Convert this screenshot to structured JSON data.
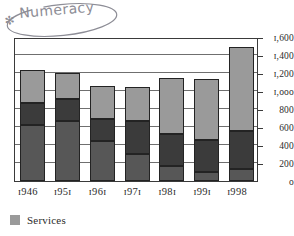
{
  "annotation": {
    "text": "Numeracy",
    "star_glyph": "✻",
    "color": "#8d8d96"
  },
  "legend": {
    "position": "below-chart",
    "entries": [
      {
        "label": "Services",
        "color": "#9a9a9a"
      }
    ]
  },
  "colors": {
    "services": "#9a9a9a",
    "middle_segment": "#3b3b3b",
    "base_segment": "#575757",
    "axis": "#3a3a3a",
    "gridline": "#6f6f6f",
    "text": "#2b2b2b"
  },
  "chart_data": {
    "type": "bar",
    "title": "",
    "subtitle": "",
    "xlabel": "",
    "ylabel": "",
    "stacked": true,
    "grid": true,
    "legend_position": "bottom-left",
    "ylim": [
      0,
      1600
    ],
    "ytick_values": [
      0,
      200,
      400,
      600,
      800,
      1000,
      1200,
      1400,
      1600
    ],
    "ytick_labels": [
      "o",
      "200",
      "400",
      "600",
      "800",
      "ɪ,ooo",
      "ɪ,200",
      "ɪ,400",
      "ɪ,600"
    ],
    "categories": [
      "1946",
      "1951",
      "1961",
      "1971",
      "1981",
      "1991",
      "1998"
    ],
    "category_labels": [
      "ɪ946",
      "ɪ95ɪ",
      "ɪ96ɪ",
      "ɪ97ɪ",
      "ɪ98ɪ",
      "ɪ99ɪ",
      "ɪ998"
    ],
    "series": [
      {
        "name": "base",
        "color": "#575757",
        "values": [
          620,
          665,
          445,
          300,
          165,
          105,
          130
        ]
      },
      {
        "name": "middle",
        "color": "#3b3b3b",
        "values": [
          245,
          245,
          245,
          365,
          355,
          355,
          430
        ]
      },
      {
        "name": "Services",
        "color": "#9a9a9a",
        "values": [
          365,
          295,
          365,
          380,
          625,
          675,
          930
        ]
      }
    ],
    "totals": [
      1230,
      1205,
      1055,
      1045,
      1145,
      1135,
      1490
    ]
  }
}
